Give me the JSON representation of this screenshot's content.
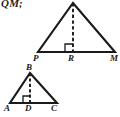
{
  "figure": {
    "caption_fragment": "QM;",
    "background_color": "#ffffff",
    "stroke_color": "#1a1a1a"
  },
  "triangles": [
    {
      "id": "upper-triangle",
      "name": "triangle-PRM",
      "vertices": [
        {
          "label": "P",
          "x": 38,
          "y": 52,
          "label_x": 33,
          "label_y": 54
        },
        {
          "label": "M",
          "x": 115,
          "y": 52,
          "label_x": 110,
          "label_y": 54
        },
        {
          "label": "",
          "x": 73,
          "y": 3,
          "label_x": 69,
          "label_y": -4
        }
      ],
      "foot": {
        "label": "R",
        "x": 73,
        "y": 52,
        "label_x": 68,
        "label_y": 54
      },
      "altitude": {
        "from_x": 73,
        "from_y": 3,
        "to_x": 73,
        "to_y": 52,
        "style": "dashed"
      },
      "right_angle": {
        "x": 73,
        "y": 52,
        "size": 8,
        "opens": "left"
      }
    },
    {
      "id": "lower-triangle",
      "name": "triangle-ABC",
      "vertices": [
        {
          "label": "A",
          "x": 10,
          "y": 103,
          "label_x": 5,
          "label_y": 105
        },
        {
          "label": "C",
          "x": 57,
          "y": 103,
          "label_x": 52,
          "label_y": 105
        },
        {
          "label": "B",
          "x": 30,
          "y": 73,
          "label_x": 26,
          "label_y": 63
        }
      ],
      "foot": {
        "label": "D",
        "x": 30,
        "y": 103,
        "label_x": 25,
        "label_y": 105
      },
      "altitude": {
        "from_x": 30,
        "from_y": 73,
        "to_x": 30,
        "to_y": 103,
        "style": "dashed"
      },
      "right_angle": {
        "x": 30,
        "y": 103,
        "size": 7,
        "opens": "left"
      }
    }
  ]
}
